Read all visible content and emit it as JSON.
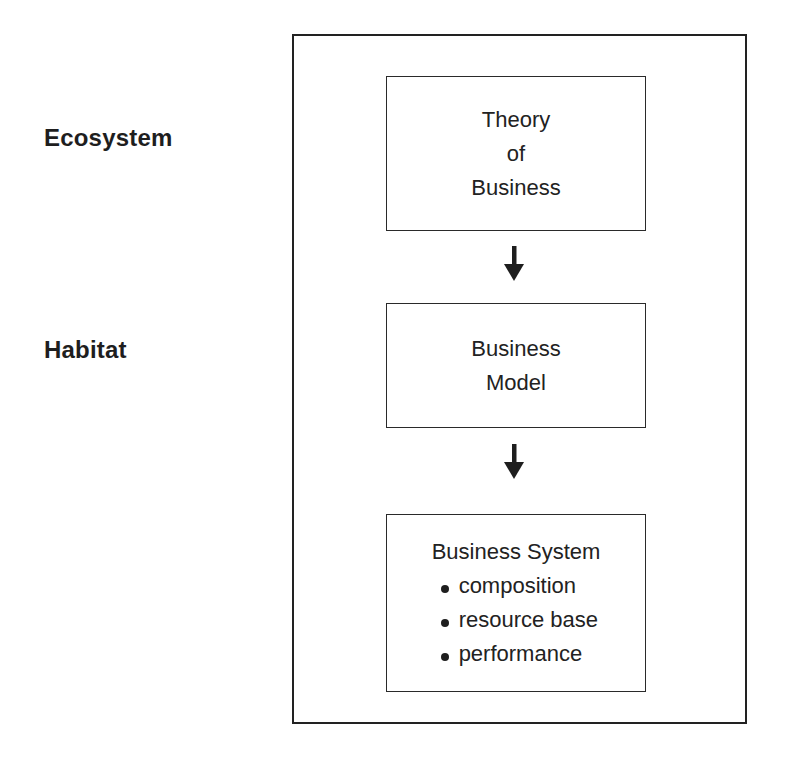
{
  "diagram": {
    "side_labels": {
      "ecosystem": "Ecosystem",
      "habitat": "Habitat"
    },
    "stages": [
      {
        "id": "theory-of-business",
        "lines": [
          "Theory",
          "of",
          "Business"
        ]
      },
      {
        "id": "business-model",
        "lines": [
          "Business",
          "Model"
        ]
      },
      {
        "id": "business-system",
        "title": "Business System",
        "bullets": [
          "composition",
          "resource base",
          "performance"
        ]
      }
    ],
    "arrows": [
      {
        "from": "theory-of-business",
        "to": "business-model",
        "icon": "down-arrow-icon"
      },
      {
        "from": "business-model",
        "to": "business-system",
        "icon": "down-arrow-icon"
      }
    ],
    "colors": {
      "stroke": "#222222",
      "text": "#1f1f1f",
      "background": "#ffffff"
    }
  }
}
